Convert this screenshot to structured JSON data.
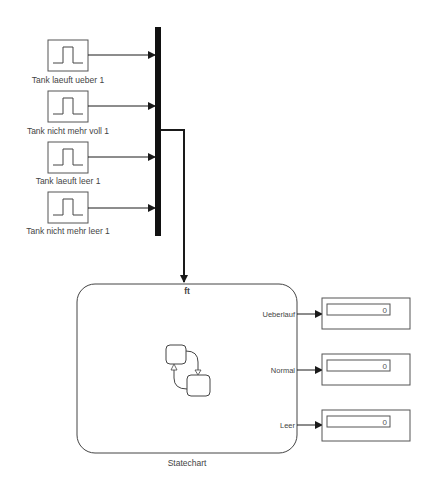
{
  "diagram": {
    "pulse_sources": [
      {
        "label": "Tank laeuft ueber 1"
      },
      {
        "label": "Tank nicht mehr voll 1"
      },
      {
        "label": "Tank laeuft leer 1"
      },
      {
        "label": "Tank nicht mehr leer 1"
      }
    ],
    "bus": {
      "type": "mux"
    },
    "statechart": {
      "label": "Statechart",
      "trigger_symbol": "ft",
      "outputs": [
        {
          "port": "Ueberlauf"
        },
        {
          "port": "Normal"
        },
        {
          "port": "Leer"
        }
      ]
    },
    "displays": [
      {
        "value": "0"
      },
      {
        "value": "0"
      },
      {
        "value": "0"
      }
    ],
    "colors": {
      "line": "#1a1a1a",
      "block_border": "#555555",
      "background": "#ffffff"
    }
  }
}
